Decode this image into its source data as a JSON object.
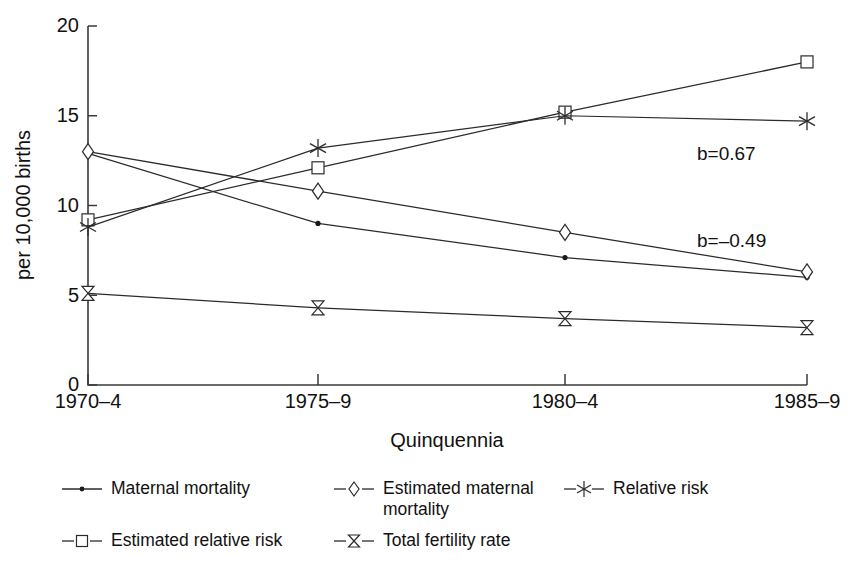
{
  "chart_data": {
    "type": "line",
    "title": "",
    "subtitle": "",
    "xlabel": "Quinquennia",
    "ylabel": "per 10,000 births",
    "categories": [
      "1970–4",
      "1975–9",
      "1980–4",
      "1985–9"
    ],
    "ylim": [
      0,
      20
    ],
    "yticks": [
      0,
      5,
      10,
      15,
      20
    ],
    "ytick_labels": [
      "0",
      "5",
      "10",
      "15",
      "20"
    ],
    "grid": false,
    "legend_position": "bottom",
    "series": [
      {
        "name": "Maternal mortality",
        "marker": "dot",
        "values": [
          12.9,
          9.0,
          7.1,
          6.0
        ]
      },
      {
        "name": "Estimated maternal mortality",
        "marker": "diamond",
        "values": [
          13.0,
          10.8,
          8.5,
          6.3
        ]
      },
      {
        "name": "Estimated relative risk",
        "marker": "square",
        "values": [
          9.2,
          12.1,
          15.2,
          18.0
        ]
      },
      {
        "name": "Relative risk",
        "marker": "asterisk",
        "values": [
          8.8,
          13.2,
          15.0,
          14.7
        ]
      },
      {
        "name": "Total fertility rate",
        "marker": "hourglass",
        "values": [
          5.1,
          4.3,
          3.7,
          3.2
        ]
      }
    ],
    "annotations": [
      {
        "text": "b=0.67",
        "x_px": 697,
        "y_px": 160
      },
      {
        "text": "b=–0.49",
        "x_px": 697,
        "y_px": 247
      }
    ]
  },
  "axes": {
    "ylabel": "per 10,000 births",
    "xlabel": "Quinquennia",
    "ytick_labels": [
      "20",
      "15",
      "10",
      "5",
      "0"
    ],
    "xtick_labels": [
      "1970–4",
      "1975–9",
      "1980–4",
      "1985–9"
    ]
  },
  "annotations": {
    "slope_positive": "b=0.67",
    "slope_negative": "b=–0.49"
  },
  "legend": {
    "items": [
      {
        "label": "Maternal mortality",
        "marker": "dot"
      },
      {
        "label": "Estimated maternal\nmortality",
        "marker": "diamond"
      },
      {
        "label": "Relative risk",
        "marker": "asterisk"
      },
      {
        "label": "Estimated relative risk",
        "marker": "square"
      },
      {
        "label": "Total fertility rate",
        "marker": "hourglass"
      }
    ]
  },
  "colors": {
    "line": "#2b2b2b",
    "axis": "#3a3a3a",
    "text": "#111111",
    "background": "#ffffff"
  }
}
